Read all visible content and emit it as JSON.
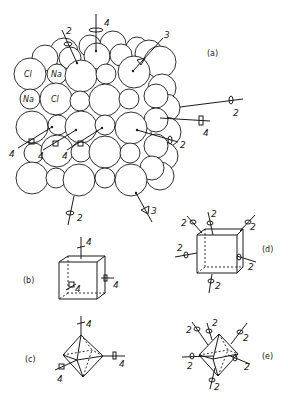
{
  "figure": {
    "panels": [
      {
        "id": "a",
        "label": "(a)",
        "content": "NaCl crystal packing with symmetry axes",
        "atoms": [
          {
            "symbol": "Cl"
          },
          {
            "symbol": "Na"
          },
          {
            "symbol": "Na"
          },
          {
            "symbol": "Cl"
          }
        ],
        "axis_labels": [
          "4",
          "2",
          "3",
          "2",
          "4",
          "2",
          "4",
          "4",
          "4",
          "2",
          "3"
        ]
      },
      {
        "id": "b",
        "label": "(b)",
        "content": "Cube with 4-fold axes",
        "axis_labels": [
          "4",
          "4",
          "4"
        ]
      },
      {
        "id": "c",
        "label": "(c)",
        "content": "Octahedron with 4-fold axes",
        "axis_labels": [
          "4",
          "4",
          "4"
        ]
      },
      {
        "id": "d",
        "label": "(d)",
        "content": "Cube with 2-fold axes",
        "axis_labels": [
          "2",
          "2",
          "2",
          "2",
          "2",
          "2"
        ]
      },
      {
        "id": "e",
        "label": "(e)",
        "content": "Octahedron with 2-fold axes",
        "axis_labels": [
          "2",
          "2",
          "2",
          "2",
          "2",
          "2"
        ]
      }
    ]
  },
  "text": {
    "a": "(a)",
    "b": "(b)",
    "c": "(c)",
    "d": "(d)",
    "e": "(e)",
    "cl": "Cl",
    "na": "Na",
    "two": "2",
    "three": "3",
    "four": "4"
  }
}
